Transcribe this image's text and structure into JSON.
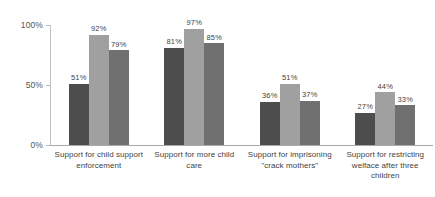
{
  "chart_data": {
    "type": "bar",
    "title": "",
    "subtitle": "",
    "xlabel": "",
    "ylabel": "",
    "ylim": [
      0,
      100
    ],
    "grid": false,
    "legend": "none",
    "y_ticks": [
      "0%",
      "50%",
      "100%"
    ],
    "y_tick_values": [
      0,
      50,
      100
    ],
    "categories": [
      "Support for child support enforcement",
      "Support for more child care",
      "Support for imprisoning \"crack mothers\"",
      "Support for restricting welface after three children"
    ],
    "series": [
      {
        "name": "series-1",
        "color": "#4d4d4d",
        "values": [
          51,
          81,
          36,
          27
        ]
      },
      {
        "name": "series-2",
        "color": "#a0a0a0",
        "values": [
          92,
          97,
          51,
          44
        ]
      },
      {
        "name": "series-3",
        "color": "#707070",
        "values": [
          79,
          85,
          37,
          33
        ]
      }
    ],
    "data_labels": [
      [
        "51%",
        "92%",
        "79%"
      ],
      [
        "81%",
        "97%",
        "85%"
      ],
      [
        "36%",
        "51%",
        "37%"
      ],
      [
        "27%",
        "44%",
        "33%"
      ]
    ],
    "axis_color": "#a9a9a9",
    "background": "#ffffff"
  }
}
